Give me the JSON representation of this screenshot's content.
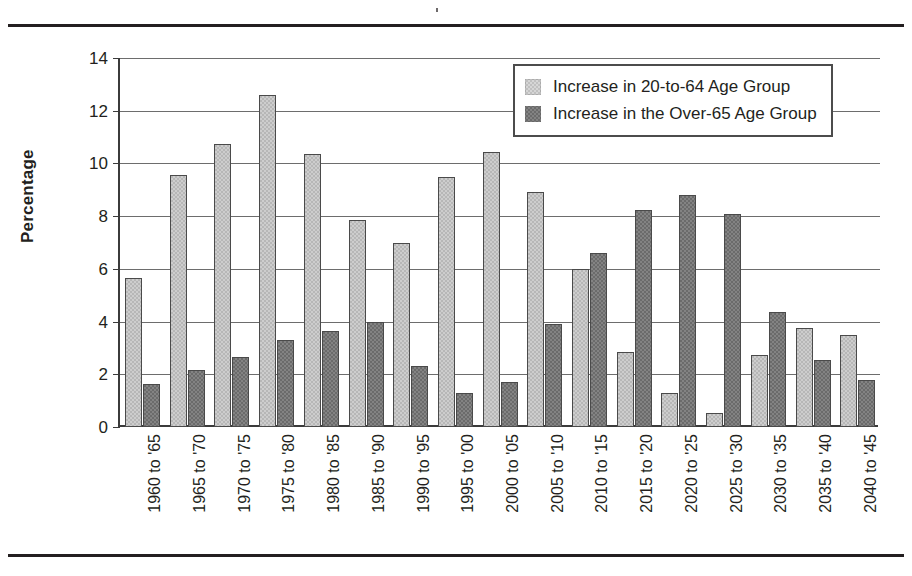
{
  "chart_data": {
    "type": "bar",
    "title": "",
    "subtitle": "",
    "xlabel": "",
    "ylabel": "Percentage",
    "ylim": [
      0,
      14
    ],
    "ytick_step": 2,
    "yticks": [
      0,
      2,
      4,
      6,
      8,
      10,
      12,
      14
    ],
    "grid": "horizontal",
    "legend_position": "top-right",
    "categories": [
      "1960 to '65",
      "1965 to '70",
      "1970 to '75",
      "1975 to '80",
      "1980 to '85",
      "1985 to '90",
      "1990 to '95",
      "1995 to '00",
      "2000 to '05",
      "2005 to '10",
      "2010 to '15",
      "2015 to '20",
      "2020 to '25",
      "2025 to '30",
      "2030 to '35",
      "2035 to '40",
      "2040 to '45"
    ],
    "series": [
      {
        "name": "Increase in 20-to-64 Age Group",
        "color": "#b7b7b7",
        "values": [
          5.65,
          9.55,
          10.75,
          12.6,
          10.35,
          7.85,
          7.0,
          9.5,
          10.45,
          8.9,
          6.0,
          2.85,
          1.3,
          0.55,
          2.75,
          3.75,
          3.5
        ]
      },
      {
        "name": "Increase in the Over-65 Age Group",
        "color": "#6b6b6b",
        "values": [
          1.65,
          2.15,
          2.65,
          3.3,
          3.65,
          4.0,
          2.3,
          1.3,
          1.7,
          3.9,
          6.6,
          8.25,
          8.8,
          8.1,
          4.35,
          2.55,
          1.8
        ]
      }
    ]
  },
  "legend": {
    "items": [
      {
        "label": "Increase in 20-to-64 Age Group",
        "swatch": "light"
      },
      {
        "label": "Increase in the Over-65 Age Group",
        "swatch": "dark"
      }
    ]
  },
  "axes": {
    "y_title": "Percentage"
  }
}
